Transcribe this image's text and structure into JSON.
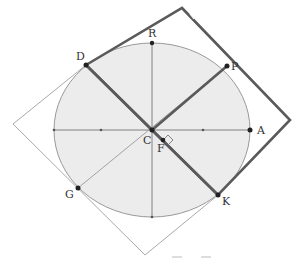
{
  "diagram": {
    "colors": {
      "ellipse_fill": "#ececec",
      "ellipse_stroke": "#999999",
      "thick_line": "#5a5a5a",
      "thin_line": "#aaaaaa",
      "axis": "#777777",
      "point": "#222222"
    },
    "labels": {
      "A": "A",
      "R": "R",
      "C": "C",
      "D": "D",
      "P": "P",
      "F": "F",
      "G": "G",
      "K": "K"
    }
  }
}
